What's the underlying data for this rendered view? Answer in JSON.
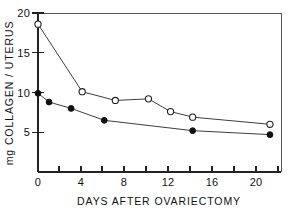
{
  "chart_data": {
    "type": "line",
    "title": "",
    "subtitle": "",
    "xlabel": "DAYS AFTER OVARIECTOMY",
    "ylabel": "mg COLLAGEN / UTERUS",
    "xlim": [
      0,
      22
    ],
    "ylim": [
      0,
      20
    ],
    "grid": false,
    "legend_position": "none",
    "x_ticks_major": [
      0,
      4,
      8,
      12,
      16,
      20
    ],
    "x_tick_labels": [
      "0",
      "4",
      "8",
      "12",
      "16",
      "20"
    ],
    "x_ticks_minor": [
      2,
      6,
      10,
      14,
      18,
      22
    ],
    "y_ticks_major": [
      5,
      10,
      15,
      20
    ],
    "y_tick_labels": [
      "5",
      "10",
      "15",
      "20"
    ],
    "series": [
      {
        "name": "open-circle-series",
        "marker": "open-circle",
        "color": "#222222",
        "x": [
          0,
          4,
          7,
          10,
          12,
          14,
          21
        ],
        "values": [
          18.6,
          10.1,
          9.0,
          9.2,
          7.6,
          6.9,
          6.0
        ]
      },
      {
        "name": "filled-circle-series",
        "marker": "filled-circle",
        "color": "#111111",
        "x": [
          0,
          1,
          3,
          6,
          14,
          21
        ],
        "values": [
          9.9,
          8.8,
          8.0,
          6.5,
          5.2,
          4.7
        ]
      }
    ]
  },
  "figure": {
    "background_color": "#ffffff",
    "axis_color": "#222222"
  }
}
